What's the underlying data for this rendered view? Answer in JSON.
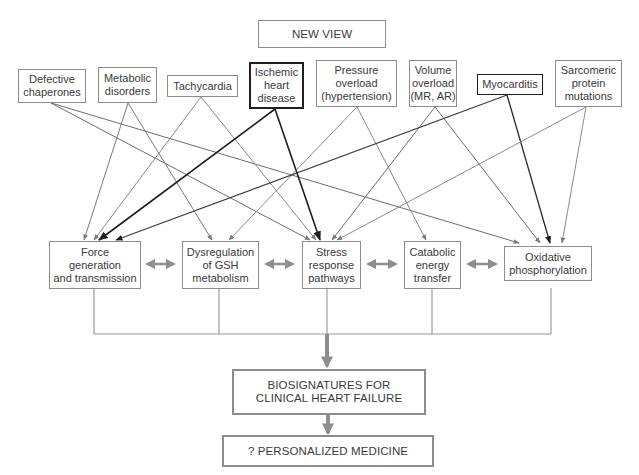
{
  "diagram": {
    "title": "NEW VIEW",
    "causes": [
      {
        "id": "defective-chaperones",
        "label": "Defective\nchaperones",
        "emphasis": false
      },
      {
        "id": "metabolic-disorders",
        "label": "Metabolic\ndisorders",
        "emphasis": false
      },
      {
        "id": "tachycardia",
        "label": "Tachycardia",
        "emphasis": false
      },
      {
        "id": "ischemic-heart-disease",
        "label": "Ischemic\nheart\ndisease",
        "emphasis": true
      },
      {
        "id": "pressure-overload",
        "label": "Pressure\noverload\n(hypertension)",
        "emphasis": false
      },
      {
        "id": "volume-overload",
        "label": "Volume\noverload\n(MR, AR)",
        "emphasis": false
      },
      {
        "id": "myocarditis",
        "label": "Myocarditis",
        "emphasis": true
      },
      {
        "id": "sarcomeric-protein-mutations",
        "label": "Sarcomeric\nprotein\nmutations",
        "emphasis": false
      }
    ],
    "pathways": [
      {
        "id": "force-generation",
        "label": "Force\ngeneration\nand transmission"
      },
      {
        "id": "gsh-dysregulation",
        "label": "Dysregulation\nof GSH\nmetabolism"
      },
      {
        "id": "stress-response",
        "label": "Stress\nresponse\npathways"
      },
      {
        "id": "catabolic-energy",
        "label": "Catabolic\nenergy\ntransfer"
      },
      {
        "id": "oxidative-phosphorylation",
        "label": "Oxidative\nphosphorylation"
      }
    ],
    "outcome": "BIOSIGNATURES FOR\nCLINICAL HEART FAILURE",
    "final": "? PERSONALIZED MEDICINE",
    "edges": [
      {
        "from": "defective-chaperones",
        "to": "stress-response"
      },
      {
        "from": "defective-chaperones",
        "to": "oxidative-phosphorylation"
      },
      {
        "from": "metabolic-disorders",
        "to": "force-generation"
      },
      {
        "from": "metabolic-disorders",
        "to": "gsh-dysregulation"
      },
      {
        "from": "tachycardia",
        "to": "force-generation"
      },
      {
        "from": "tachycardia",
        "to": "stress-response"
      },
      {
        "from": "ischemic-heart-disease",
        "to": "force-generation",
        "emphasis": true
      },
      {
        "from": "ischemic-heart-disease",
        "to": "stress-response",
        "emphasis": true
      },
      {
        "from": "pressure-overload",
        "to": "gsh-dysregulation"
      },
      {
        "from": "pressure-overload",
        "to": "catabolic-energy"
      },
      {
        "from": "volume-overload",
        "to": "stress-response"
      },
      {
        "from": "volume-overload",
        "to": "oxidative-phosphorylation"
      },
      {
        "from": "myocarditis",
        "to": "force-generation",
        "emphasis": true
      },
      {
        "from": "myocarditis",
        "to": "oxidative-phosphorylation",
        "emphasis": true
      },
      {
        "from": "sarcomeric-protein-mutations",
        "to": "stress-response"
      },
      {
        "from": "sarcomeric-protein-mutations",
        "to": "oxidative-phosphorylation"
      }
    ],
    "colors": {
      "box_border": "#8c8c8c",
      "emphasis_border": "#1e1e1e",
      "edge_gray": "#7a7a7a",
      "edge_dark": "#333333",
      "double_arrow": "#8e8e8e",
      "text": "#3a3a3a",
      "background": "#ffffff"
    }
  }
}
